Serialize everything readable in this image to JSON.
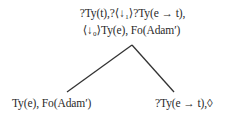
{
  "tree": {
    "root": {
      "line1": "?Ty(t),?⟨↓₁⟩?Ty(e → t),",
      "line2": "⟨↓₀⟩Ty(e), Fo(Adam′)"
    },
    "children": [
      {
        "label": "Ty(e), Fo(Adam′)"
      },
      {
        "label": "?Ty(e → t),◊"
      }
    ],
    "edges": [
      {
        "from": [
          132,
          45
        ],
        "to": [
          67,
          92
        ]
      },
      {
        "from": [
          132,
          45
        ],
        "to": [
          174,
          92
        ]
      }
    ],
    "line_color": "#333333"
  }
}
